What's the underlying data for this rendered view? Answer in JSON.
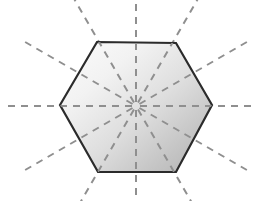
{
  "figure": {
    "kind": "geometry-diagram",
    "canvas": {
      "width": 256,
      "height": 201,
      "background_color": "#ffffff"
    },
    "shape": {
      "name": "hexagon",
      "sides": 6,
      "orientation": "flat-top",
      "center": {
        "x": 136,
        "y": 106
      },
      "vertices": [
        {
          "label": "left",
          "x": 60,
          "y": 105
        },
        {
          "label": "upper-left",
          "x": 97,
          "y": 42
        },
        {
          "label": "upper-right",
          "x": 176,
          "y": 43
        },
        {
          "label": "right",
          "x": 212,
          "y": 105
        },
        {
          "label": "lower-right",
          "x": 176,
          "y": 172
        },
        {
          "label": "lower-left",
          "x": 98,
          "y": 172
        }
      ],
      "outline_color": "#2b2b2b",
      "outline_width": 2.2,
      "fill_gradient": {
        "type": "linear",
        "angle_deg": 135,
        "stops": [
          {
            "offset": 0.0,
            "color": "#fcfcfc"
          },
          {
            "offset": 0.28,
            "color": "#f2f2f2"
          },
          {
            "offset": 0.55,
            "color": "#dedede"
          },
          {
            "offset": 0.78,
            "color": "#c6c6c6"
          },
          {
            "offset": 1.0,
            "color": "#b0b0b0"
          }
        ]
      }
    },
    "symmetry_lines": {
      "count": 12,
      "angle_step_deg": 30,
      "stroke_color": "#8f8f8f",
      "stroke_width": 2,
      "dash_pattern": "7 6",
      "inner_radius": 4,
      "outer_radius": 128,
      "rays": [
        {
          "index": 1,
          "angle_deg": 0,
          "direction": "right"
        },
        {
          "index": 2,
          "angle_deg": 30,
          "direction": "right-down"
        },
        {
          "index": 3,
          "angle_deg": 60,
          "direction": "down-right"
        },
        {
          "index": 4,
          "angle_deg": 90,
          "direction": "down"
        },
        {
          "index": 5,
          "angle_deg": 120,
          "direction": "down-left"
        },
        {
          "index": 6,
          "angle_deg": 150,
          "direction": "left-down"
        },
        {
          "index": 7,
          "angle_deg": 180,
          "direction": "left"
        },
        {
          "index": 8,
          "angle_deg": 210,
          "direction": "left-up"
        },
        {
          "index": 9,
          "angle_deg": 240,
          "direction": "up-left"
        },
        {
          "index": 10,
          "angle_deg": 270,
          "direction": "up"
        },
        {
          "index": 11,
          "angle_deg": 300,
          "direction": "up-right"
        },
        {
          "index": 12,
          "angle_deg": 330,
          "direction": "right-up"
        }
      ]
    }
  }
}
